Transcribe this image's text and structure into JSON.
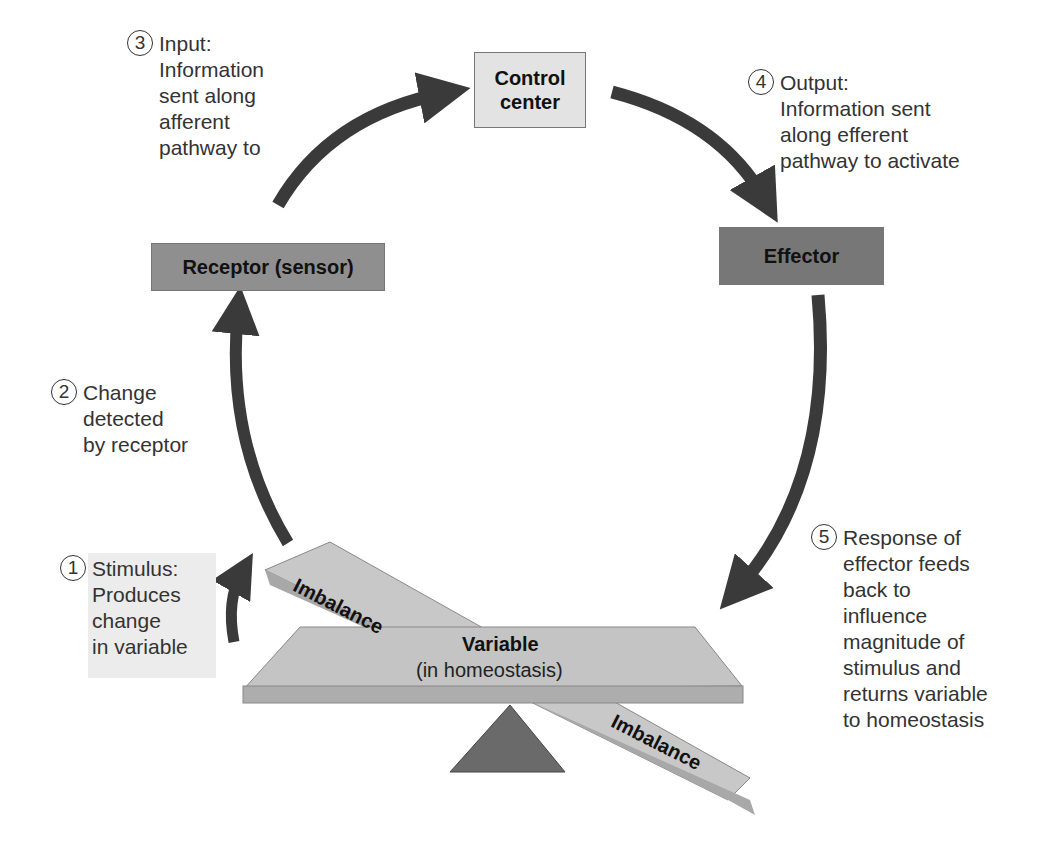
{
  "boxes": {
    "control_center": {
      "label": "Control\ncenter",
      "color": "#e3e3e3"
    },
    "receptor": {
      "label": "Receptor (sensor)",
      "color": "#8f8f8f"
    },
    "effector": {
      "label": "Effector",
      "color": "#777777"
    }
  },
  "steps": [
    {
      "number": "1",
      "text": "Stimulus:\nProduces\nchange\nin variable"
    },
    {
      "number": "2",
      "text": "Change\ndetected\nby receptor"
    },
    {
      "number": "3",
      "text": "Input:\nInformation\nsent along\nafferent\npathway to"
    },
    {
      "number": "4",
      "text": "Output:\nInformation sent\nalong efferent\npathway to activate"
    },
    {
      "number": "5",
      "text": "Response of\neffector feeds\nback to\ninfluence\nmagnitude of\nstimulus and\nreturns variable\nto homeostasis"
    }
  ],
  "balance": {
    "variable_label": "Variable",
    "variable_sub": "(in homeostasis)",
    "imbalance_left": "Imbalance",
    "imbalance_right": "Imbalance"
  },
  "colors": {
    "arrow": "#3a3a3a",
    "plank": "#c4c4c4",
    "fulcrum": "#6a6a6a"
  }
}
